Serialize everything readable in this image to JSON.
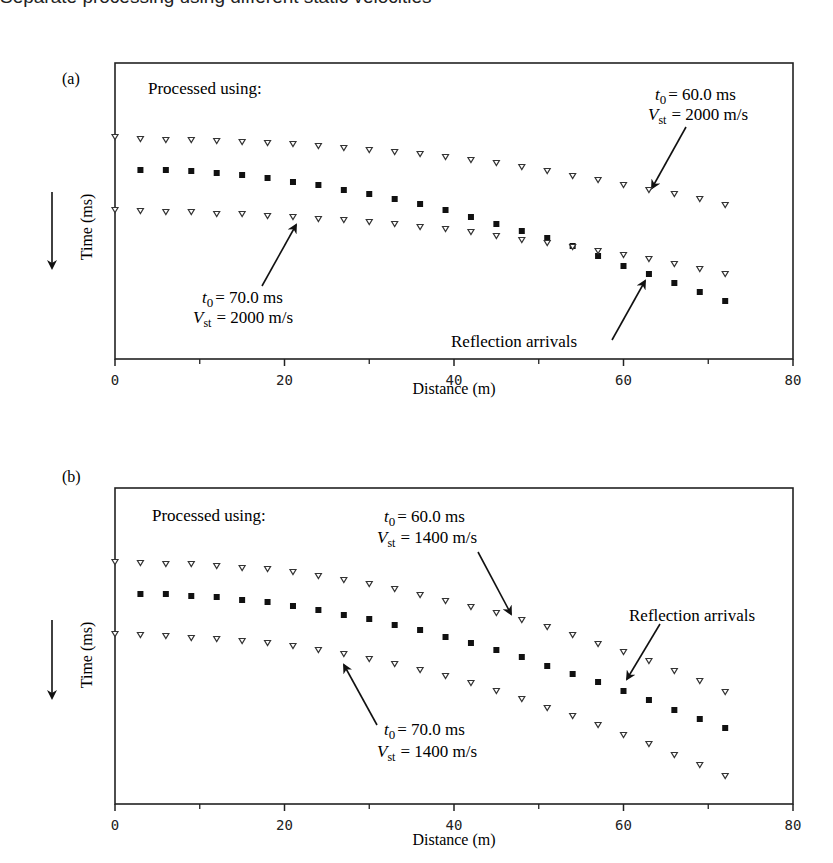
{
  "clipped_caption": "Separate processing using different static velocities",
  "chart_data": [
    {
      "panel": "(a)",
      "type": "scatter",
      "title": "",
      "xlabel": "Distance (m)",
      "ylabel": "Time (ms)",
      "y_direction": "down",
      "xlim": [
        0,
        80
      ],
      "xticks": [
        0,
        20,
        40,
        60,
        80
      ],
      "xminor": [
        10,
        30,
        50,
        70
      ],
      "grid": false,
      "header_note": "Processed using:",
      "annotations": [
        {
          "label_line1": "t0 = 60.0 ms",
          "label_line2": "Vst = 2000 m/s",
          "points_to_x": 63,
          "series": "upper"
        },
        {
          "label_line1": "t0 = 70.0 ms",
          "label_line2": "Vst = 2000 m/s",
          "points_to_x": 21,
          "series": "lower"
        },
        {
          "label": "Reflection arrivals",
          "points_to_x": 63,
          "series": "reflection"
        }
      ],
      "x": [
        0,
        3,
        6,
        9,
        12,
        15,
        18,
        21,
        24,
        27,
        30,
        33,
        36,
        39,
        42,
        45,
        48,
        51,
        54,
        57,
        60,
        63,
        66,
        69,
        72
      ],
      "series": [
        {
          "name": "t0 = 60.0 ms, Vst = 2000 m/s",
          "marker": "open-triangle",
          "y_px": [
            137,
            139,
            140,
            140,
            141,
            142,
            143,
            144,
            146,
            148,
            150,
            152,
            154,
            157,
            160,
            163,
            167,
            171,
            176,
            180,
            185,
            190,
            194,
            199,
            205
          ]
        },
        {
          "name": "Reflection arrivals",
          "marker": "filled-square",
          "starts_at_x": 3,
          "y_px": [
            null,
            170,
            170,
            171,
            173,
            175,
            178,
            182,
            185,
            190,
            194,
            199,
            204,
            210,
            217,
            224,
            231,
            238,
            246,
            256,
            266,
            274,
            283,
            292,
            301
          ]
        },
        {
          "name": "t0 = 70.0 ms, Vst = 2000 m/s",
          "marker": "open-triangle",
          "y_px": [
            210,
            211,
            212,
            212,
            214,
            214,
            216,
            217,
            219,
            220,
            222,
            224,
            227,
            229,
            232,
            236,
            240,
            243,
            247,
            251,
            255,
            259,
            264,
            269,
            274
          ]
        }
      ]
    },
    {
      "panel": "(b)",
      "type": "scatter",
      "title": "",
      "xlabel": "Distance (m)",
      "ylabel": "Time (ms)",
      "y_direction": "down",
      "xlim": [
        0,
        80
      ],
      "xticks": [
        0,
        20,
        40,
        60,
        80
      ],
      "xminor": [
        10,
        30,
        50,
        70
      ],
      "grid": false,
      "header_note": "Processed using:",
      "annotations": [
        {
          "label_line1": "t0 = 60.0 ms",
          "label_line2": "Vst = 1400 m/s",
          "points_to_x": 48,
          "series": "upper"
        },
        {
          "label_line1": "t0 = 70.0 ms",
          "label_line2": "Vst = 1400 m/s",
          "points_to_x": 27,
          "series": "lower"
        },
        {
          "label": "Reflection arrivals",
          "points_to_x": 60,
          "series": "reflection"
        }
      ],
      "x": [
        0,
        3,
        6,
        9,
        12,
        15,
        18,
        21,
        24,
        27,
        30,
        33,
        36,
        39,
        42,
        45,
        48,
        51,
        54,
        57,
        60,
        63,
        66,
        69,
        72
      ],
      "series": [
        {
          "name": "t0 = 60.0 ms, Vst = 1400 m/s",
          "marker": "open-triangle",
          "y_px": [
            562,
            563,
            564,
            564,
            566,
            568,
            569,
            572,
            576,
            580,
            584,
            589,
            595,
            601,
            607,
            613,
            620,
            627,
            635,
            644,
            652,
            661,
            671,
            681,
            692
          ]
        },
        {
          "name": "Reflection arrivals",
          "marker": "filled-square",
          "starts_at_x": 3,
          "y_px": [
            null,
            594,
            594,
            596,
            597,
            600,
            602,
            606,
            610,
            615,
            619,
            625,
            630,
            637,
            643,
            650,
            657,
            666,
            674,
            682,
            691,
            700,
            710,
            719,
            728
          ]
        },
        {
          "name": "t0 = 70.0 ms, Vst = 1400 m/s",
          "marker": "open-triangle",
          "y_px": [
            634,
            635,
            636,
            638,
            639,
            641,
            643,
            646,
            650,
            654,
            659,
            664,
            670,
            676,
            683,
            691,
            699,
            708,
            716,
            725,
            735,
            744,
            755,
            765,
            776
          ]
        }
      ]
    }
  ],
  "panels": {
    "a": {
      "label": "(a)",
      "note": "Processed using:",
      "ann1_t": "= 60.0 ms",
      "ann1_v": "= 2000 m/s",
      "ann2_t": "= 70.0 ms",
      "ann2_v": "= 2000 m/s",
      "reflection": "Reflection arrivals",
      "xlabel": "Distance (m)",
      "ylabel": "Time (ms)",
      "ticks": [
        "0",
        "20",
        "40",
        "60",
        "80"
      ]
    },
    "b": {
      "label": "(b)",
      "note": "Processed using:",
      "ann1_t": "= 60.0 ms",
      "ann1_v": "= 1400 m/s",
      "ann2_t": "= 70.0 ms",
      "ann2_v": "= 1400 m/s",
      "reflection": "Reflection arrivals",
      "xlabel": "Distance (m)",
      "ylabel": "Time (ms)",
      "ticks": [
        "0",
        "20",
        "40",
        "60",
        "80"
      ]
    },
    "sym": {
      "t": "t",
      "zero": "0",
      "v": "V",
      "st": "st"
    }
  }
}
